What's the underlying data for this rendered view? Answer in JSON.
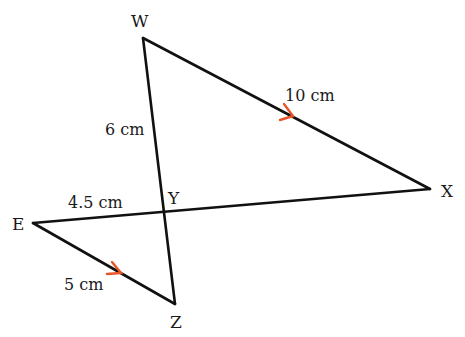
{
  "diagram": {
    "type": "geometry",
    "colors": {
      "line": "#111111",
      "arrow": "#e8542a",
      "text": "#1a1a1a"
    },
    "vertices": {
      "W": {
        "label": "W",
        "x": 143,
        "y": 38
      },
      "X": {
        "label": "X",
        "x": 430,
        "y": 189
      },
      "Y": {
        "label": "Y",
        "x": 164,
        "y": 213
      },
      "E": {
        "label": "E",
        "x": 33,
        "y": 223
      },
      "Z": {
        "label": "Z",
        "x": 175,
        "y": 304
      }
    },
    "segments": [
      {
        "from": "W",
        "to": "X",
        "length_label": "10 cm",
        "parallel_mark": true
      },
      {
        "from": "W",
        "to": "Y",
        "length_label": "6 cm",
        "parallel_mark": false
      },
      {
        "from": "E",
        "to": "Y",
        "length_label": "4.5 cm",
        "parallel_mark": false
      },
      {
        "from": "E",
        "to": "Z",
        "length_label": "5 cm",
        "parallel_mark": true
      },
      {
        "from": "Y",
        "to": "X",
        "length_label": "",
        "parallel_mark": false
      },
      {
        "from": "Y",
        "to": "Z",
        "length_label": "",
        "parallel_mark": false
      }
    ],
    "labels": {
      "W": "W",
      "X": "X",
      "Y": "Y",
      "E": "E",
      "Z": "Z",
      "wx_length": "10 cm",
      "wy_length": "6 cm",
      "ey_length": "4.5 cm",
      "ez_length": "5 cm"
    }
  }
}
